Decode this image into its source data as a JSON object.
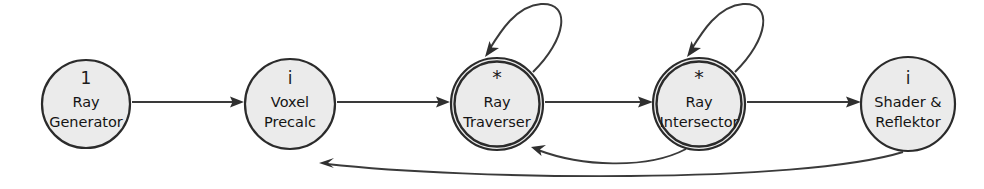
{
  "diagram": {
    "background_color": "#ffffff",
    "node_fill_color": "#ebebeb",
    "node_stroke_color": "#2b2b2b",
    "edge_color": "#3a3a3a",
    "nodes": [
      {
        "id": "ray-generator",
        "marker": "1",
        "line1": "Ray",
        "line2": "Generator",
        "cx": 86,
        "cy": 104,
        "r": 44,
        "double_ring": false,
        "self_loop": false
      },
      {
        "id": "voxel-precalc",
        "marker": "i",
        "line1": "Voxel",
        "line2": "Precalc",
        "cx": 290,
        "cy": 104,
        "r": 45,
        "double_ring": false,
        "self_loop": false
      },
      {
        "id": "ray-traverser",
        "marker": "*",
        "line1": "Ray",
        "line2": "Traverser",
        "cx": 497,
        "cy": 104,
        "r": 46,
        "double_ring": true,
        "self_loop": true
      },
      {
        "id": "ray-intersector",
        "marker": "*",
        "line1": "Ray",
        "line2": "Intersector",
        "cx": 699,
        "cy": 104,
        "r": 46,
        "double_ring": true,
        "self_loop": true
      },
      {
        "id": "shader-reflektor",
        "marker": "i",
        "line1": "Shader &",
        "line2": "Reflektor",
        "cx": 908,
        "cy": 104,
        "r": 47,
        "double_ring": false,
        "self_loop": false
      }
    ],
    "edges": [
      {
        "id": "gen-to-voxel",
        "from": "ray-generator",
        "to": "voxel-precalc",
        "kind": "straight"
      },
      {
        "id": "voxel-to-traverser",
        "from": "voxel-precalc",
        "to": "ray-traverser",
        "kind": "straight"
      },
      {
        "id": "traverser-to-intersector",
        "from": "ray-traverser",
        "to": "ray-intersector",
        "kind": "straight"
      },
      {
        "id": "intersector-to-shader",
        "from": "ray-intersector",
        "to": "shader-reflektor",
        "kind": "straight"
      },
      {
        "id": "traverser-self-loop",
        "from": "ray-traverser",
        "to": "ray-traverser",
        "kind": "self-loop"
      },
      {
        "id": "intersector-self-loop",
        "from": "ray-intersector",
        "to": "ray-intersector",
        "kind": "self-loop"
      },
      {
        "id": "intersector-to-traverser-feedback",
        "from": "ray-intersector",
        "to": "ray-traverser",
        "kind": "feedback-curve"
      },
      {
        "id": "shader-to-voxel-feedback",
        "from": "shader-reflektor",
        "to": "voxel-precalc",
        "kind": "feedback-curve"
      }
    ]
  }
}
